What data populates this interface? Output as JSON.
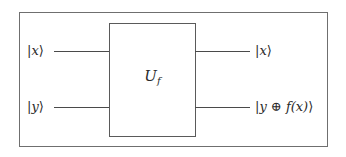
{
  "diagram": {
    "type": "quantum-circuit",
    "gate": {
      "label_main": "U",
      "label_sub": "f"
    },
    "inputs": [
      {
        "open": "|",
        "var": "x",
        "close": "⟩"
      },
      {
        "open": "|",
        "var": "y",
        "close": "⟩"
      }
    ],
    "outputs": [
      {
        "open": "|",
        "var": "x",
        "close": "⟩"
      },
      {
        "open": "|",
        "var": "y ⊕ f(x)",
        "close": "⟩"
      }
    ],
    "colors": {
      "frame": "#6f6f6f",
      "gate_border": "#5a5a5a",
      "wire": "#4a4a4a",
      "text": "#2a2a2a"
    }
  }
}
